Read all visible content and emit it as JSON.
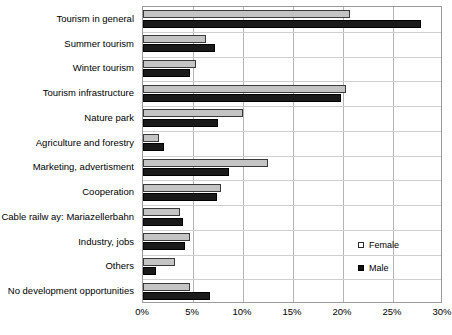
{
  "chart_data": {
    "type": "bar",
    "orientation": "horizontal",
    "title": "",
    "xlabel": "",
    "ylabel": "",
    "xlim": [
      0,
      30
    ],
    "xticks": [
      0,
      5,
      10,
      15,
      20,
      25,
      30
    ],
    "xtick_labels": [
      "0%",
      "5%",
      "10%",
      "15%",
      "20%",
      "25%",
      "30%"
    ],
    "grid": true,
    "legend_position": "right-lower",
    "categories": [
      "Tourism in general",
      "Summer tourism",
      "Winter tourism",
      "Tourism infrastructure",
      "Nature park",
      "Agriculture and forestry",
      "Marketing, advertisment",
      "Cooperation",
      "Cable railw ay: Mariazellerbahn",
      "Industry, jobs",
      "Others",
      "No development opportunities"
    ],
    "series": [
      {
        "name": "Female",
        "color": "#c4c4c4",
        "values": [
          20.7,
          6.3,
          5.3,
          20.3,
          10.0,
          1.6,
          12.5,
          7.8,
          3.7,
          4.7,
          3.2,
          4.7
        ]
      },
      {
        "name": "Male",
        "color": "#1a1a1a",
        "values": [
          27.8,
          7.2,
          4.7,
          19.8,
          7.5,
          2.1,
          8.6,
          7.4,
          4.0,
          4.2,
          1.3,
          6.7
        ]
      }
    ]
  },
  "legend": {
    "items": [
      {
        "label": "Female",
        "marker": "open-square-swatch"
      },
      {
        "label": "Male",
        "marker": "filled-square-swatch"
      }
    ]
  }
}
